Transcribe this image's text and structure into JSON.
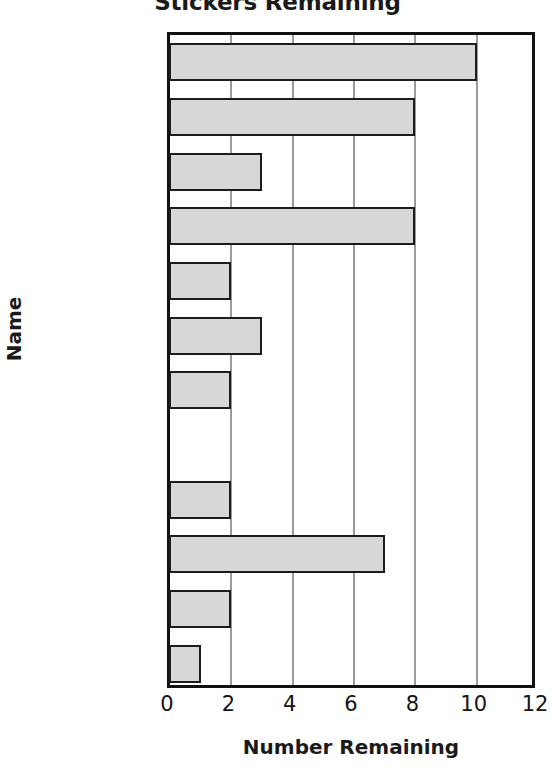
{
  "chart_data": {
    "type": "bar",
    "orientation": "horizontal",
    "title": "Stickers Remaining",
    "xlabel": "Number Remaining",
    "ylabel": "Name",
    "categories": [
      "Ana",
      "Angela",
      "Andy",
      "Andrew",
      "Andrea",
      "Amy",
      "Amber",
      "Amanda",
      "Allison",
      "Alicia",
      "Adam",
      "Aaron"
    ],
    "values": [
      10,
      8,
      3,
      8,
      2,
      3,
      2,
      0,
      2,
      7,
      2,
      1
    ],
    "xlim": [
      0,
      12
    ],
    "xticks": [
      0,
      2,
      4,
      6,
      8,
      10,
      12
    ],
    "xtick_labels": [
      "0",
      "2",
      "4",
      "6",
      "8",
      "10",
      "12"
    ],
    "gridlines": [
      "x"
    ],
    "grid": true,
    "legend": "none",
    "bar_fill_color": "#d7d7d7",
    "bar_edge_color": "#1c1c1c",
    "gridline_color": "#9a9a9a",
    "axis_color": "#111111",
    "background_color": "#ffffff",
    "text_color": "#141414"
  }
}
